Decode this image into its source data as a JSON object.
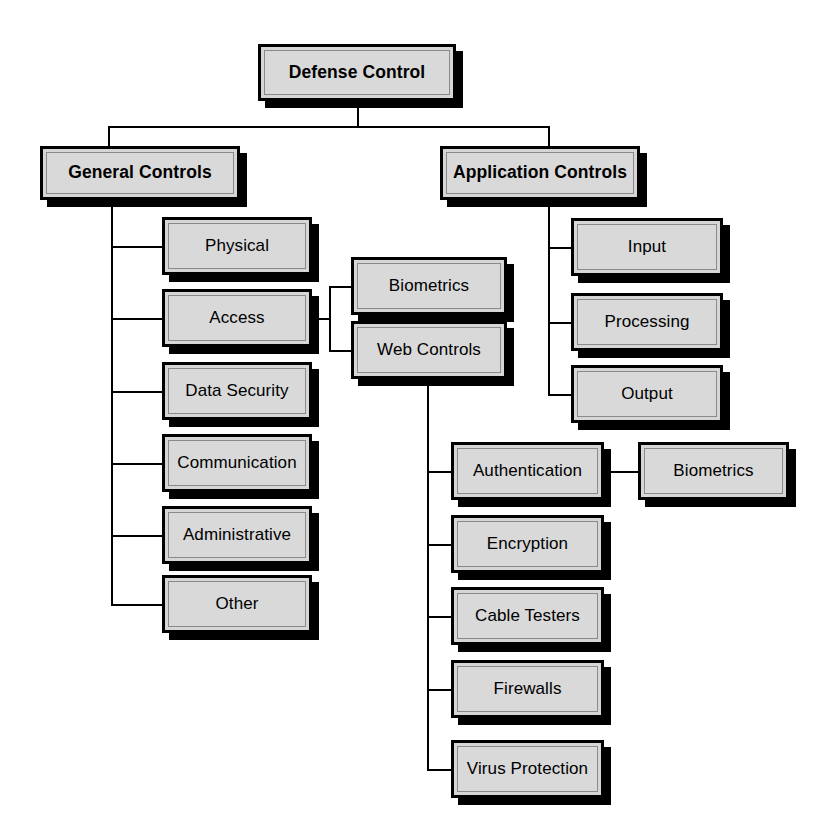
{
  "diagram": {
    "title": "Defense Control",
    "type": "hierarchy-tree",
    "background_color": "#ffffff",
    "box_fill_color": "#d6d6d6",
    "box_border_color": "#000000",
    "shadow_color": "#000000",
    "text_color": "#000000"
  },
  "nodes": {
    "root": {
      "label": "Defense Control"
    },
    "general_controls": {
      "label": "General Controls"
    },
    "application_controls": {
      "label": "Application Controls"
    },
    "general_children": [
      {
        "label": "Physical"
      },
      {
        "label": "Access"
      },
      {
        "label": "Data Security"
      },
      {
        "label": "Communication"
      },
      {
        "label": "Administrative"
      },
      {
        "label": "Other"
      }
    ],
    "access_children": [
      {
        "label": "Biometrics"
      },
      {
        "label": "Web Controls"
      }
    ],
    "application_children": [
      {
        "label": "Input"
      },
      {
        "label": "Processing"
      },
      {
        "label": "Output"
      }
    ],
    "web_controls_children": [
      {
        "label": "Authentication"
      },
      {
        "label": "Encryption"
      },
      {
        "label": "Cable Testers"
      },
      {
        "label": "Firewalls"
      },
      {
        "label": "Virus Protection"
      }
    ],
    "authentication_children": [
      {
        "label": "Biometrics"
      }
    ]
  }
}
